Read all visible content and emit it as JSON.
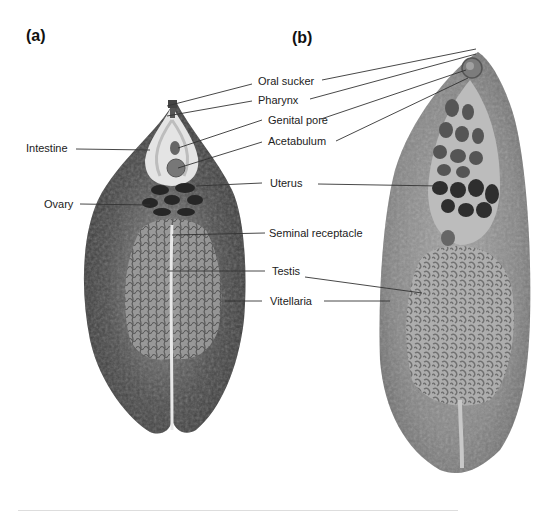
{
  "figure": {
    "panels": [
      {
        "id": "a",
        "label": "(a)"
      },
      {
        "id": "b",
        "label": "(b)"
      }
    ],
    "labels": {
      "oral_sucker": "Oral sucker",
      "pharynx": "Pharynx",
      "genital_pore": "Genital pore",
      "acetabulum": "Acetabulum",
      "uterus": "Uterus",
      "intestine": "Intestine",
      "ovary": "Ovary",
      "seminal_receptacle": "Seminal receptacle",
      "testis": "Testis",
      "vitellaria": "Vitellaria"
    },
    "colors": {
      "specimen_a_body": "#3a3a3a",
      "specimen_a_inner": "#9a9a9a",
      "specimen_b_body": "#7a7a7a",
      "specimen_b_inner": "#a8a8a8",
      "uterus_dark": "#2e2e2e"
    }
  }
}
